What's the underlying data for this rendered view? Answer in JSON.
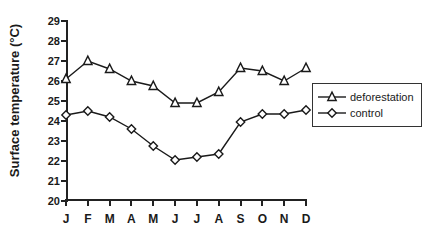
{
  "chart_data": {
    "type": "line",
    "title": "",
    "subtitle": "",
    "xlabel": "",
    "ylabel": "Surface temperature (°C)",
    "categories": [
      "J",
      "F",
      "M",
      "A",
      "M",
      "J",
      "J",
      "A",
      "S",
      "O",
      "N",
      "D"
    ],
    "xtick_labels": [
      "J",
      "F",
      "M",
      "A",
      "M",
      "J",
      "J",
      "A",
      "S",
      "O",
      "N",
      "D"
    ],
    "ytick_labels": [
      "29",
      "28",
      "27",
      "26",
      "25",
      "24",
      "23",
      "22",
      "21",
      "20"
    ],
    "ylim": [
      20,
      29
    ],
    "ytick_step": 1,
    "grid": false,
    "legend_position": "right-outside",
    "series": [
      {
        "name": "deforestation",
        "marker": "open-triangle",
        "color": "#1a1a1a",
        "values": [
          26.1,
          27.0,
          26.6,
          26.0,
          25.75,
          24.9,
          24.9,
          25.45,
          26.65,
          26.5,
          26.0,
          26.65
        ]
      },
      {
        "name": "control",
        "marker": "open-diamond",
        "color": "#1a1a1a",
        "values": [
          24.3,
          24.5,
          24.2,
          23.6,
          22.75,
          22.05,
          22.2,
          22.35,
          23.95,
          24.35,
          24.35,
          24.55
        ]
      }
    ]
  },
  "legend": {
    "entries": [
      {
        "label": "deforestation",
        "marker": "open-triangle"
      },
      {
        "label": "control",
        "marker": "open-diamond"
      }
    ]
  }
}
